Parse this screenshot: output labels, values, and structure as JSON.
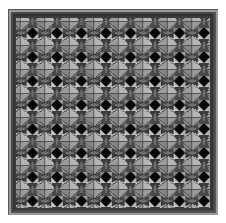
{
  "artwork": {
    "title": "Framed Geometric Tile Pattern",
    "description": "Square decorative panel with a beveled gray frame enclosing a repeating grayscale tessellation of four-pointed star rosettes, diamonds and black squares.",
    "canvas": {
      "width": 226,
      "height": 223,
      "background": "#ffffff"
    },
    "frame": {
      "name": "beveled-border",
      "x": 8,
      "y": 9,
      "width": 210,
      "height": 206,
      "outer_color": "#5a5a5a",
      "bevel_light": "#8d8d8d",
      "bevel_dark": "#3f3f3f",
      "thickness": 7
    },
    "field": {
      "x": 15,
      "y": 16,
      "width": 196,
      "height": 192,
      "background": "#6e6e6e",
      "grid_columns": 8,
      "grid_rows": 8,
      "cell_width": 24.5,
      "cell_height": 24.0
    },
    "palette": {
      "black": "#080808",
      "dark_gray": "#3a3a3a",
      "mid_gray": "#6e6e6e",
      "gray": "#8c8c8c",
      "light_gray": "#b4b4b4",
      "pale_gray": "#cfcfcf",
      "outline": "#2a2a2a",
      "white": "#ffffff"
    },
    "motif": {
      "name": "star-rosette-tile",
      "black_square_size": 11,
      "petal_color": "#b4b4b4",
      "wing_color": "#8c8c8c",
      "diamond_color": "#cfcfcf",
      "shadow_color": "#3a3a3a"
    }
  }
}
